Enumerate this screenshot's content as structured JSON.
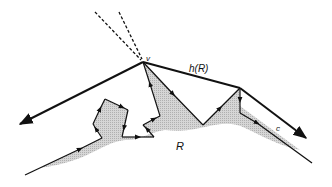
{
  "figure": {
    "labels": {
      "vertex": "v",
      "hull": "h(R)",
      "region": "R",
      "chain": "c"
    },
    "colors": {
      "stroke": "#111111",
      "region_fill": "#c8c8c8",
      "background": "#ffffff"
    }
  }
}
